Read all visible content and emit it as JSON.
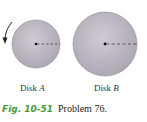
{
  "figure": {
    "disks": [
      {
        "name": "Disk",
        "letter": "A",
        "cx": 36,
        "cy": 44,
        "r": 24
      },
      {
        "name": "Disk",
        "letter": "B",
        "cx": 105,
        "cy": 44,
        "r": 32
      }
    ],
    "rotation_arrow": "counterclockwise-arrow",
    "colors": {
      "disk_fill": "#bdb8c2",
      "disk_edge": "#8f8a95",
      "caption_green": "#4a9a3a"
    }
  },
  "labels": {
    "disk_a_prefix": "Disk",
    "disk_a_letter": "A",
    "disk_b_prefix": "Disk",
    "disk_b_letter": "B"
  },
  "caption": {
    "fig_number": "Fig. 10-51",
    "problem": "Problem 76."
  }
}
